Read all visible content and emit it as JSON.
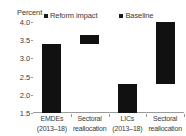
{
  "chart_data": {
    "type": "bar",
    "title": "",
    "subtitle": "",
    "unit_label": "Percent",
    "xlabel": "",
    "ylabel": "Percent",
    "ylim": [
      1.5,
      4.0
    ],
    "ytick_values": [
      4.0,
      3.5,
      3.0,
      2.5,
      2.0,
      1.5
    ],
    "ytick_labels": [
      "4.0",
      "3.5",
      "3.0",
      "2.5",
      "2.0",
      "1.5"
    ],
    "grid": false,
    "legend_position": "top",
    "legend": [
      {
        "label": "Reform impact",
        "color": "#111111"
      },
      {
        "label": "Baseline",
        "color": "#111111"
      }
    ],
    "categories": [
      {
        "line1": "EMDEs",
        "line2": "(2013–18)"
      },
      {
        "line1": "Sectoral",
        "line2": "reallocation"
      },
      {
        "line1": "LICs",
        "line2": "(2013–18)"
      },
      {
        "line1": "Sectoral",
        "line2": "reallocation"
      }
    ],
    "bars": [
      {
        "category": "EMDEs (2013-18)",
        "series": "Baseline",
        "base": 1.5,
        "top": 3.4,
        "value": 3.4
      },
      {
        "category": "Sectoral reallocation",
        "series": "Reform impact",
        "base": 3.4,
        "top": 3.65,
        "value": 0.25
      },
      {
        "category": "LICs (2013-18)",
        "series": "Baseline",
        "base": 1.5,
        "top": 2.3,
        "value": 2.3
      },
      {
        "category": "Sectoral reallocation",
        "series": "Reform impact",
        "base": 2.3,
        "top": 4.0,
        "value": 1.7
      }
    ]
  }
}
